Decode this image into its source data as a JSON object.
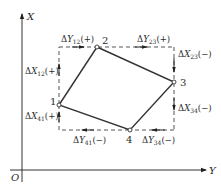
{
  "figure": {
    "axes": {
      "vertical_label": "X",
      "horizontal_label": "Y",
      "origin_label": "O"
    },
    "points": [
      {
        "id": "1",
        "label": "1",
        "x": 59,
        "y": 105
      },
      {
        "id": "2",
        "label": "2",
        "x": 97,
        "y": 47
      },
      {
        "id": "3",
        "label": "3",
        "x": 174,
        "y": 82
      },
      {
        "id": "4",
        "label": "4",
        "x": 130,
        "y": 130
      }
    ],
    "polygon_order": [
      "1",
      "2",
      "3",
      "4"
    ],
    "increments": {
      "dX12": {
        "prefix": "Δ",
        "var": "X",
        "sub": "12",
        "sign": "(+)"
      },
      "dY12": {
        "prefix": "Δ",
        "var": "Y",
        "sub": "12",
        "sign": "(+)"
      },
      "dY23": {
        "prefix": "Δ",
        "var": "Y",
        "sub": "23",
        "sign": "(+)"
      },
      "dX23": {
        "prefix": "Δ",
        "var": "X",
        "sub": "23",
        "sign": "(−)"
      },
      "dX34": {
        "prefix": "Δ",
        "var": "X",
        "sub": "34",
        "sign": "(−)"
      },
      "dY34": {
        "prefix": "Δ",
        "var": "Y",
        "sub": "34",
        "sign": "(−)"
      },
      "dY41": {
        "prefix": "Δ",
        "var": "Y",
        "sub": "41",
        "sign": "(−)"
      },
      "dX41": {
        "prefix": "Δ",
        "var": "X",
        "sub": "41",
        "sign": "(+)"
      }
    },
    "colors": {
      "line": "#333333",
      "dashed": "#444444",
      "text": "#2a2a2a"
    }
  }
}
